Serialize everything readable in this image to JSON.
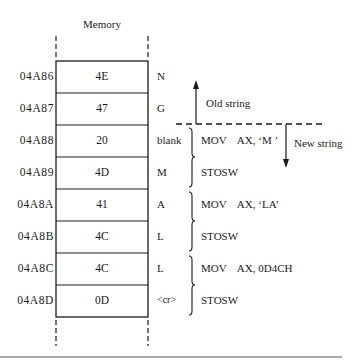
{
  "title": "Memory",
  "rows": [
    {
      "address": "04A86",
      "value": "4E",
      "char": "N"
    },
    {
      "address": "04A87",
      "value": "47",
      "char": "G"
    },
    {
      "address": "04A88",
      "value": "20",
      "char": "blank"
    },
    {
      "address": "04A89",
      "value": "4D",
      "char": "M"
    },
    {
      "address": "04A8A",
      "value": "41",
      "char": "A"
    },
    {
      "address": "04A8B",
      "value": "4C",
      "char": "L"
    },
    {
      "address": "04A8C",
      "value": "4C",
      "char": "L"
    },
    {
      "address": "04A8D",
      "value": "0D",
      "char": "<cr>"
    }
  ],
  "instructions": [
    {
      "line1": "MOV    AX, ‘M ’",
      "line2": "STOSW"
    },
    {
      "line1": "MOV    AX, ‘LA’",
      "line2": "STOSW"
    },
    {
      "line1": "MOV    AX, 0D4CH",
      "line2": "STOSW"
    }
  ],
  "annotations": {
    "old_string": "Old string",
    "new_string": "New string"
  },
  "icons": {
    "up_arrow": "arrow-up-icon",
    "down_arrow": "arrow-down-icon",
    "brace": "right-curly-brace"
  }
}
